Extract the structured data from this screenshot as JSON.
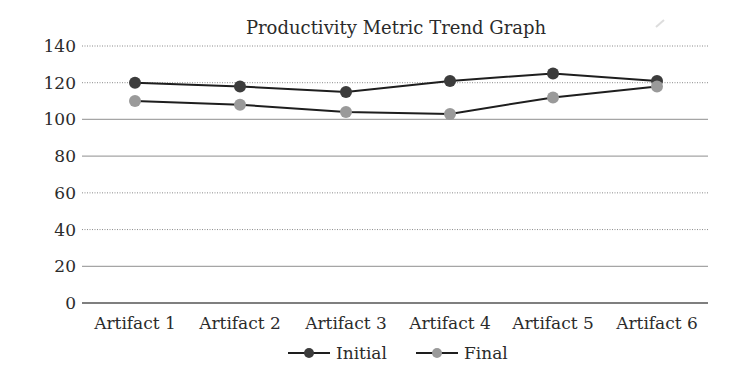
{
  "chart_data": {
    "type": "line",
    "title": "Productivity Metric Trend Graph",
    "xlabel": "",
    "ylabel": "",
    "categories": [
      "Artifact 1",
      "Artifact 2",
      "Artifact 3",
      "Artifact 4",
      "Artifact 5",
      "Artifact 6"
    ],
    "series": [
      {
        "name": "Initial",
        "color": "#3c3c3c",
        "values": [
          120,
          118,
          115,
          121,
          125,
          121
        ]
      },
      {
        "name": "Final",
        "color": "#9a9a9a",
        "values": [
          110,
          108,
          104,
          103,
          112,
          118
        ]
      }
    ],
    "ylim": [
      0,
      140
    ],
    "yticks": [
      0,
      20,
      40,
      60,
      80,
      100,
      120,
      140
    ],
    "grid": true,
    "legend_position": "bottom"
  },
  "layout": {
    "plot_left": 82,
    "plot_right": 708,
    "plot_top": 46,
    "plot_bottom": 303,
    "category_x": [
      135,
      240,
      346,
      450,
      553,
      657
    ],
    "dotted_gridlines": [
      140,
      120,
      60,
      40
    ],
    "solid_gridlines": [
      100,
      80,
      20
    ]
  }
}
